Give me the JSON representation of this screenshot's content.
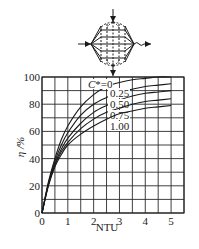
{
  "chart_data": {
    "type": "line",
    "title": "",
    "xlabel": "NTU",
    "ylabel": "η /%",
    "xlim": [
      0,
      5.5
    ],
    "ylim": [
      0,
      100
    ],
    "xticks": [
      "0",
      "1",
      "2",
      "3",
      "4",
      "5"
    ],
    "yticks": [
      "0",
      "20",
      "40",
      "60",
      "80",
      "100"
    ],
    "grid": true,
    "grid_step_x": 0.5,
    "grid_step_y": 10,
    "legend_position": "inline-labels",
    "x": [
      0,
      0.25,
      0.5,
      0.75,
      1,
      1.5,
      2,
      2.5,
      3,
      3.5,
      4,
      4.5,
      5
    ],
    "series": [
      {
        "name": "C*=0",
        "label": "C*=0",
        "values": [
          0,
          23,
          40,
          54,
          64,
          78,
          87,
          93,
          96,
          98,
          99,
          100,
          100
        ]
      },
      {
        "name": "C*=0.25",
        "label": "0.25",
        "values": [
          0,
          22,
          38,
          50,
          59,
          72,
          80,
          85,
          89,
          91,
          93,
          94,
          95
        ]
      },
      {
        "name": "C*=0.50",
        "label": "0.50",
        "values": [
          0,
          21,
          36,
          47,
          55,
          66,
          74,
          79,
          83,
          86,
          88,
          89,
          90
        ]
      },
      {
        "name": "C*=0.75",
        "label": "0.75",
        "values": [
          0,
          21,
          35,
          45,
          52,
          62,
          69,
          74,
          77,
          80,
          82,
          83,
          84
        ]
      },
      {
        "name": "C*=1.00",
        "label": "1.00",
        "values": [
          0,
          20,
          34,
          43,
          50,
          58,
          64,
          69,
          73,
          75,
          77,
          78,
          79
        ]
      }
    ],
    "annotations": [
      "C*=0",
      "0.25",
      "0.50",
      "0.75",
      "1.00"
    ],
    "inset_diagram": "cross-flow heat exchanger schematic (both fluids unmixed)"
  },
  "labels": {
    "xlabel": "NTU",
    "ylabel": "η /%",
    "cstar_prefix": "C*=0"
  }
}
